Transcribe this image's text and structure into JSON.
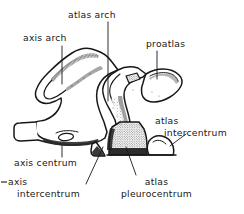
{
  "figure": {
    "kind": "anatomical-line-drawing",
    "background_color": "#ffffff",
    "ink_color": "#171717",
    "labels": [
      {
        "id": "axis-arch",
        "text": "axis arch",
        "lines": [
          "axis arch"
        ],
        "leader": "vertical"
      },
      {
        "id": "atlas-arch",
        "text": "atlas arch",
        "lines": [
          "atlas arch"
        ],
        "leader": "vertical"
      },
      {
        "id": "proatlas",
        "text": "proatlas",
        "lines": [
          "proatlas"
        ],
        "leader": "vertical"
      },
      {
        "id": "atlas-intercentrum",
        "text": "atlas intercentrum",
        "lines": [
          "atlas",
          "intercentrum"
        ],
        "leader": "diagonal"
      },
      {
        "id": "axis-centrum",
        "text": "axis centrum",
        "lines": [
          "axis centrum"
        ],
        "leader": "vertical"
      },
      {
        "id": "axis-intercentrum",
        "text": "axis intercentrum",
        "lines": [
          "axis",
          "intercentrum"
        ],
        "leader": "diagonal"
      },
      {
        "id": "atlas-pleurocentrum",
        "text": "atlas pleurocentrum",
        "lines": [
          "atlas",
          "pleurocentrum"
        ],
        "leader": "diagonal"
      }
    ],
    "marks": {
      "left_edge_dash": "-"
    }
  }
}
